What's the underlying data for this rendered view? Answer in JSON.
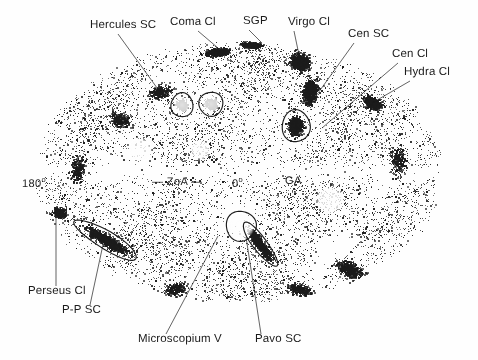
{
  "figure": {
    "kind": "all-sky-galaxy-distribution-map",
    "projection": "elliptical-aitoff",
    "background_color": "#fefefe",
    "ink_color": "#1b1b1b"
  },
  "labels": {
    "hercules_sc": "Hercules SC",
    "coma_cl": "Coma Cl",
    "sgp": "SGP",
    "virgo_cl": "Virgo Cl",
    "cen_sc": "Cen SC",
    "cen_cl": "Cen Cl",
    "hydra_cl": "Hydra Cl",
    "perseus_cl": "Perseus Cl",
    "pp_sc": "P-P SC",
    "microscopium_v": "Microscopium V",
    "pavo_sc": "Pavo SC"
  },
  "coordinates": {
    "left_longitude": "180",
    "left_longitude_unit": "o",
    "zoa": "— ZoA —",
    "center_longitude": "0",
    "center_longitude_unit": "o",
    "great_attractor": "GA"
  },
  "chart_data": {
    "type": "scatter",
    "title": "",
    "xlabel": "",
    "ylabel": "",
    "ellipse": {
      "cx": 239,
      "cy": 172,
      "rx": 206,
      "ry": 132
    },
    "annotations": [
      {
        "name": "Hercules SC",
        "label_x": 90,
        "label_y": 20,
        "target_x": 160,
        "target_y": 92,
        "type": "supercluster"
      },
      {
        "name": "Coma Cl",
        "label_x": 170,
        "label_y": 17,
        "target_x": 218,
        "target_y": 48,
        "type": "cluster"
      },
      {
        "name": "SGP",
        "label_x": 243,
        "label_y": 16,
        "target_x": 262,
        "target_y": 43,
        "type": "pole"
      },
      {
        "name": "Virgo Cl",
        "label_x": 288,
        "label_y": 17,
        "target_x": 299,
        "target_y": 55,
        "type": "cluster"
      },
      {
        "name": "Cen SC",
        "label_x": 348,
        "label_y": 29,
        "target_x": 313,
        "target_y": 100,
        "type": "supercluster"
      },
      {
        "name": "Cen Cl",
        "label_x": 392,
        "label_y": 49,
        "target_x": 322,
        "target_y": 128,
        "type": "cluster"
      },
      {
        "name": "Hydra Cl",
        "label_x": 404,
        "label_y": 67,
        "target_x": 372,
        "target_y": 103,
        "type": "cluster"
      },
      {
        "name": "Perseus Cl",
        "label_x": 28,
        "label_y": 286,
        "target_x": 56,
        "target_y": 215,
        "type": "cluster"
      },
      {
        "name": "P-P SC",
        "label_x": 62,
        "label_y": 305,
        "target_x": 104,
        "target_y": 240,
        "type": "supercluster"
      },
      {
        "name": "Microscopium V",
        "label_x": 138,
        "label_y": 334,
        "target_x": 218,
        "target_y": 236,
        "type": "void"
      },
      {
        "name": "Pavo SC",
        "label_x": 255,
        "label_y": 334,
        "target_x": 246,
        "target_y": 237,
        "type": "supercluster"
      }
    ],
    "coordinate_markers": [
      {
        "text": "180",
        "superscript": "o",
        "x": 22,
        "y": 176
      },
      {
        "text": "— ZoA —",
        "superscript": "",
        "x": 152,
        "y": 177
      },
      {
        "text": "0",
        "superscript": "o",
        "x": 232,
        "y": 176
      },
      {
        "text": "GA",
        "superscript": "",
        "x": 285,
        "y": 176
      }
    ],
    "marked_regions": [
      {
        "shape": "circle",
        "cx": 182,
        "cy": 105,
        "rx": 11,
        "ry": 12,
        "rot": 0,
        "name": "small-circle-left"
      },
      {
        "shape": "circle",
        "cx": 211,
        "cy": 104,
        "rx": 12,
        "ry": 12,
        "rot": 0,
        "name": "small-circle-right"
      },
      {
        "shape": "ellipse",
        "cx": 296,
        "cy": 126,
        "rx": 14,
        "ry": 16,
        "rot": 0,
        "name": "cen-cl-ellipse"
      },
      {
        "shape": "circle",
        "cx": 241,
        "cy": 226,
        "rx": 15,
        "ry": 15,
        "rot": 0,
        "name": "microscopium-void-circle"
      },
      {
        "shape": "ellipse",
        "cx": 106,
        "cy": 240,
        "rx": 36,
        "ry": 9,
        "rot": 31,
        "name": "pp-sc-ellipse"
      },
      {
        "shape": "ellipse",
        "cx": 260,
        "cy": 244,
        "rx": 27,
        "ry": 7,
        "rot": 53,
        "name": "pavo-sc-ellipse"
      }
    ]
  }
}
